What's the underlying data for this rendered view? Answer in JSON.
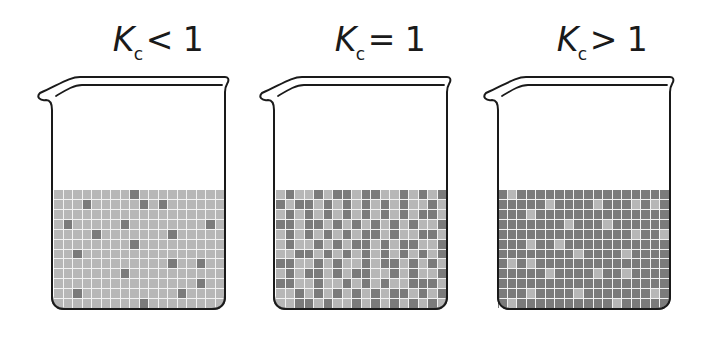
{
  "colors": {
    "light_species": "#b7b7b7",
    "dark_species": "#7b7b7b",
    "grid_lines": "#f2f2f2",
    "outline": "#1a1a1a"
  },
  "grid": {
    "columns": 18,
    "rows": 12
  },
  "beakers": [
    {
      "id": "kc-less-than-1",
      "label": {
        "symbol": "K",
        "subscript": "c",
        "relation": "< 1"
      },
      "base_color": "light",
      "minority_color": "dark",
      "minority_cells": [
        [
          0,
          8
        ],
        [
          1,
          3
        ],
        [
          1,
          9
        ],
        [
          1,
          11
        ],
        [
          3,
          1
        ],
        [
          3,
          7
        ],
        [
          3,
          16
        ],
        [
          4,
          4
        ],
        [
          4,
          12
        ],
        [
          5,
          8
        ],
        [
          6,
          2
        ],
        [
          7,
          12
        ],
        [
          7,
          15
        ],
        [
          8,
          7
        ],
        [
          9,
          15
        ],
        [
          10,
          2
        ],
        [
          10,
          13
        ],
        [
          11,
          9
        ]
      ]
    },
    {
      "id": "kc-equal-1",
      "label": {
        "symbol": "K",
        "subscript": "c",
        "relation": "= 1"
      },
      "base_color": "light",
      "minority_color": "dark",
      "minority_cells": [
        [
          0,
          1
        ],
        [
          0,
          4
        ],
        [
          0,
          6
        ],
        [
          0,
          7
        ],
        [
          0,
          9
        ],
        [
          0,
          10
        ],
        [
          0,
          13
        ],
        [
          0,
          15
        ],
        [
          0,
          17
        ],
        [
          1,
          0
        ],
        [
          1,
          2
        ],
        [
          1,
          3
        ],
        [
          1,
          5
        ],
        [
          1,
          7
        ],
        [
          1,
          9
        ],
        [
          1,
          11
        ],
        [
          1,
          13
        ],
        [
          1,
          16
        ],
        [
          2,
          1
        ],
        [
          2,
          3
        ],
        [
          2,
          5
        ],
        [
          2,
          7
        ],
        [
          2,
          9
        ],
        [
          2,
          11
        ],
        [
          2,
          13
        ],
        [
          2,
          15
        ],
        [
          2,
          16
        ],
        [
          3,
          0
        ],
        [
          3,
          1
        ],
        [
          3,
          3
        ],
        [
          3,
          4
        ],
        [
          3,
          6
        ],
        [
          3,
          8
        ],
        [
          3,
          10
        ],
        [
          3,
          12
        ],
        [
          3,
          14
        ],
        [
          3,
          17
        ],
        [
          4,
          1
        ],
        [
          4,
          3
        ],
        [
          4,
          5
        ],
        [
          4,
          7
        ],
        [
          4,
          9
        ],
        [
          4,
          10
        ],
        [
          4,
          12
        ],
        [
          4,
          15
        ],
        [
          4,
          16
        ],
        [
          5,
          1
        ],
        [
          5,
          4
        ],
        [
          5,
          6
        ],
        [
          5,
          8
        ],
        [
          5,
          9
        ],
        [
          5,
          11
        ],
        [
          5,
          13
        ],
        [
          5,
          14
        ],
        [
          5,
          17
        ],
        [
          6,
          2
        ],
        [
          6,
          3
        ],
        [
          6,
          5
        ],
        [
          6,
          7
        ],
        [
          6,
          9
        ],
        [
          6,
          11
        ],
        [
          6,
          13
        ],
        [
          6,
          15
        ],
        [
          6,
          17
        ],
        [
          7,
          0
        ],
        [
          7,
          1
        ],
        [
          7,
          4
        ],
        [
          7,
          6
        ],
        [
          7,
          9
        ],
        [
          7,
          11
        ],
        [
          7,
          12
        ],
        [
          7,
          14
        ],
        [
          7,
          16
        ],
        [
          8,
          1
        ],
        [
          8,
          3
        ],
        [
          8,
          4
        ],
        [
          8,
          6
        ],
        [
          8,
          8
        ],
        [
          8,
          9
        ],
        [
          8,
          12
        ],
        [
          8,
          14
        ],
        [
          8,
          17
        ],
        [
          9,
          0
        ],
        [
          9,
          1
        ],
        [
          9,
          4
        ],
        [
          9,
          7
        ],
        [
          9,
          9
        ],
        [
          9,
          11
        ],
        [
          9,
          14
        ],
        [
          9,
          15
        ],
        [
          9,
          16
        ],
        [
          10,
          2
        ],
        [
          10,
          4
        ],
        [
          10,
          6
        ],
        [
          10,
          8
        ],
        [
          10,
          10
        ],
        [
          10,
          12
        ],
        [
          10,
          13
        ],
        [
          10,
          15
        ],
        [
          10,
          17
        ],
        [
          11,
          2
        ],
        [
          11,
          3
        ],
        [
          11,
          5
        ],
        [
          11,
          8
        ],
        [
          11,
          10
        ],
        [
          11,
          12
        ],
        [
          11,
          14
        ],
        [
          11,
          16
        ]
      ]
    },
    {
      "id": "kc-greater-than-1",
      "label": {
        "symbol": "K",
        "subscript": "c",
        "relation": "> 1"
      },
      "base_color": "dark",
      "minority_color": "light",
      "minority_cells": [
        [
          0,
          1
        ],
        [
          1,
          5
        ],
        [
          1,
          10
        ],
        [
          1,
          14
        ],
        [
          1,
          16
        ],
        [
          2,
          3
        ],
        [
          3,
          7
        ],
        [
          3,
          11
        ],
        [
          4,
          14
        ],
        [
          4,
          17
        ],
        [
          5,
          3
        ],
        [
          5,
          6
        ],
        [
          6,
          8
        ],
        [
          6,
          13
        ],
        [
          7,
          1
        ],
        [
          7,
          3
        ],
        [
          8,
          5
        ],
        [
          8,
          10
        ],
        [
          8,
          13
        ],
        [
          10,
          3
        ],
        [
          10,
          8
        ],
        [
          10,
          16
        ],
        [
          11,
          1
        ],
        [
          11,
          12
        ]
      ]
    }
  ]
}
